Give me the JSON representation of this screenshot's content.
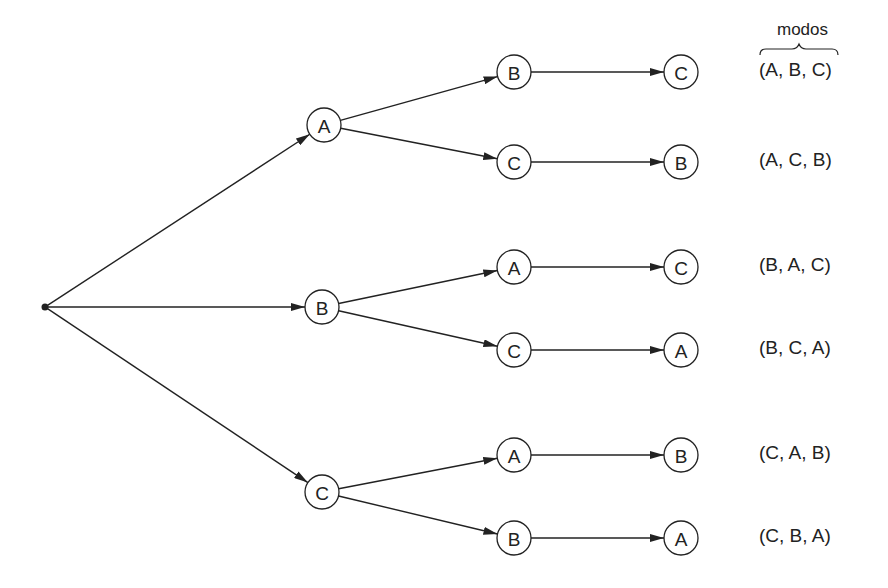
{
  "diagram": {
    "type": "tree",
    "title_label": "modos",
    "root": {
      "x": 45,
      "y": 307
    },
    "level1": [
      {
        "id": "l1-A",
        "label": "A",
        "x": 324,
        "y": 125
      },
      {
        "id": "l1-B",
        "label": "B",
        "x": 322,
        "y": 307
      },
      {
        "id": "l1-C",
        "label": "C",
        "x": 322,
        "y": 492
      }
    ],
    "level2": [
      {
        "id": "l2-0",
        "label": "B",
        "parent": 0,
        "x": 514,
        "y": 72
      },
      {
        "id": "l2-1",
        "label": "C",
        "parent": 0,
        "x": 514,
        "y": 162
      },
      {
        "id": "l2-2",
        "label": "A",
        "parent": 1,
        "x": 514,
        "y": 267
      },
      {
        "id": "l2-3",
        "label": "C",
        "parent": 1,
        "x": 514,
        "y": 350
      },
      {
        "id": "l2-4",
        "label": "A",
        "parent": 2,
        "x": 514,
        "y": 455
      },
      {
        "id": "l2-5",
        "label": "B",
        "parent": 2,
        "x": 514,
        "y": 538
      }
    ],
    "level3": [
      {
        "id": "l3-0",
        "label": "C",
        "x": 681,
        "y": 72
      },
      {
        "id": "l3-1",
        "label": "B",
        "x": 681,
        "y": 162
      },
      {
        "id": "l3-2",
        "label": "C",
        "x": 681,
        "y": 267
      },
      {
        "id": "l3-3",
        "label": "A",
        "x": 681,
        "y": 350
      },
      {
        "id": "l3-4",
        "label": "B",
        "x": 681,
        "y": 455
      },
      {
        "id": "l3-5",
        "label": "A",
        "x": 681,
        "y": 538
      }
    ],
    "outcomes": [
      "(A, B, C)",
      "(A, C, B)",
      "(B, A, C)",
      "(B, C, A)",
      "(C, A, B)",
      "(C, B, A)"
    ]
  }
}
